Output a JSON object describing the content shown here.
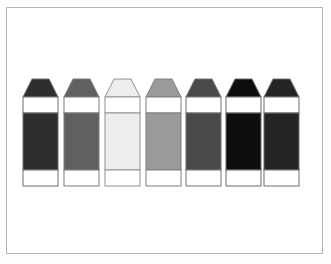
{
  "figure": {
    "title": "",
    "background_color": "#ffffff",
    "frame_color": "#b4b4b4",
    "outline_color": "#8c8c8c",
    "band_color": "#ffffff",
    "item_count": 7
  },
  "chart_data": {
    "type": "bar",
    "title": "",
    "xlabel": "",
    "ylabel": "",
    "categories": [
      "crayon-1",
      "crayon-2",
      "crayon-3",
      "crayon-4",
      "crayon-5",
      "crayon-6",
      "crayon-7"
    ],
    "values": [
      18,
      38,
      93,
      60,
      29,
      5,
      14
    ],
    "ylim": [
      0,
      100
    ],
    "grid": false,
    "legend": "none"
  },
  "crayons": [
    {
      "index": 1,
      "name": "crayon-1",
      "color": "#2e2e2e",
      "tip_color": "#2e2e2e",
      "outline": "#6e6e6e",
      "x": 23
    },
    {
      "index": 2,
      "name": "crayon-2",
      "color": "#606060",
      "tip_color": "#606060",
      "outline": "#7a7a7a",
      "x": 64
    },
    {
      "index": 3,
      "name": "crayon-3",
      "color": "#ededed",
      "tip_color": "#ededed",
      "outline": "#909090",
      "x": 105
    },
    {
      "index": 4,
      "name": "crayon-4",
      "color": "#9a9a9a",
      "tip_color": "#9a9a9a",
      "outline": "#7f7f7f",
      "x": 146
    },
    {
      "index": 5,
      "name": "crayon-5",
      "color": "#4a4a4a",
      "tip_color": "#4a4a4a",
      "outline": "#707070",
      "x": 186
    },
    {
      "index": 6,
      "name": "crayon-6",
      "color": "#0d0d0d",
      "tip_color": "#0d0d0d",
      "outline": "#6a6a6a",
      "x": 226
    },
    {
      "index": 7,
      "name": "crayon-7",
      "color": "#242424",
      "tip_color": "#242424",
      "outline": "#6e6e6e",
      "x": 264
    }
  ]
}
